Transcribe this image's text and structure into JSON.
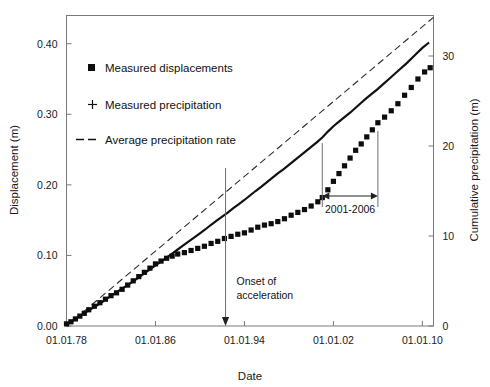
{
  "chart_data": {
    "type": "scatter",
    "title": "",
    "xlabel": "Date",
    "ylabel": "Displacement (m)",
    "y2label": "Cumulative precipitation (m)",
    "grid": false,
    "legend_position": "upper-left-inside",
    "xlim": [
      1978,
      2011
    ],
    "xtick_labels": [
      "01.01.78",
      "01.01.86",
      "01.01.94",
      "01.01.02",
      "01.01.10"
    ],
    "xtick_values": [
      1978,
      1986,
      1994,
      2002,
      2010
    ],
    "ylim": [
      0.0,
      0.44
    ],
    "ytick_labels": [
      "0.00",
      "0.10",
      "0.20",
      "0.30",
      "0.40"
    ],
    "ytick_values": [
      0.0,
      0.1,
      0.2,
      0.3,
      0.4
    ],
    "y2lim": [
      0,
      34.5
    ],
    "y2tick_labels": [
      "0",
      "10",
      "20",
      "30"
    ],
    "y2tick_values": [
      0,
      10,
      20,
      30
    ],
    "series": [
      {
        "name": "Measured displacements",
        "marker": "filled-square",
        "axis": "left",
        "units": "m",
        "points": [
          [
            1978.0,
            0.003
          ],
          [
            1978.4,
            0.006
          ],
          [
            1978.8,
            0.01
          ],
          [
            1979.2,
            0.014
          ],
          [
            1979.6,
            0.018
          ],
          [
            1980.0,
            0.023
          ],
          [
            1980.5,
            0.028
          ],
          [
            1981.0,
            0.033
          ],
          [
            1981.5,
            0.038
          ],
          [
            1982.0,
            0.043
          ],
          [
            1982.5,
            0.047
          ],
          [
            1983.0,
            0.052
          ],
          [
            1983.5,
            0.058
          ],
          [
            1984.0,
            0.064
          ],
          [
            1984.5,
            0.07
          ],
          [
            1985.0,
            0.076
          ],
          [
            1985.5,
            0.082
          ],
          [
            1986.0,
            0.088
          ],
          [
            1986.5,
            0.092
          ],
          [
            1987.0,
            0.096
          ],
          [
            1987.5,
            0.099
          ],
          [
            1988.0,
            0.102
          ],
          [
            1988.6,
            0.104
          ],
          [
            1989.2,
            0.107
          ],
          [
            1989.8,
            0.11
          ],
          [
            1990.4,
            0.113
          ],
          [
            1991.0,
            0.117
          ],
          [
            1991.6,
            0.12
          ],
          [
            1992.2,
            0.124
          ],
          [
            1992.8,
            0.127
          ],
          [
            1993.4,
            0.13
          ],
          [
            1994.0,
            0.132
          ],
          [
            1994.6,
            0.136
          ],
          [
            1995.2,
            0.14
          ],
          [
            1995.8,
            0.143
          ],
          [
            1996.4,
            0.145
          ],
          [
            1997.0,
            0.148
          ],
          [
            1997.6,
            0.152
          ],
          [
            1998.2,
            0.157
          ],
          [
            1998.8,
            0.161
          ],
          [
            1999.4,
            0.165
          ],
          [
            2000.0,
            0.17
          ],
          [
            2000.6,
            0.176
          ],
          [
            2001.0,
            0.182
          ],
          [
            2001.5,
            0.193
          ],
          [
            2002.0,
            0.205
          ],
          [
            2002.5,
            0.216
          ],
          [
            2003.0,
            0.227
          ],
          [
            2003.5,
            0.238
          ],
          [
            2004.0,
            0.249
          ],
          [
            2004.5,
            0.258
          ],
          [
            2005.0,
            0.268
          ],
          [
            2005.5,
            0.278
          ],
          [
            2006.0,
            0.288
          ],
          [
            2006.6,
            0.296
          ],
          [
            2007.2,
            0.305
          ],
          [
            2007.8,
            0.315
          ],
          [
            2008.4,
            0.327
          ],
          [
            2009.0,
            0.338
          ],
          [
            2009.6,
            0.35
          ],
          [
            2010.2,
            0.36
          ],
          [
            2010.7,
            0.366
          ]
        ]
      },
      {
        "name": "Measured precipitation",
        "marker": "plus",
        "axis": "right",
        "units": "m",
        "points": [
          [
            1978.0,
            0.2
          ],
          [
            1978.5,
            0.55
          ],
          [
            1979.0,
            0.95
          ],
          [
            1979.5,
            1.35
          ],
          [
            1980.0,
            1.75
          ],
          [
            1980.5,
            2.1
          ],
          [
            1981.0,
            2.5
          ],
          [
            1981.5,
            2.9
          ],
          [
            1982.0,
            3.35
          ],
          [
            1982.5,
            3.75
          ],
          [
            1983.0,
            4.15
          ],
          [
            1983.5,
            4.55
          ],
          [
            1984.0,
            4.95
          ],
          [
            1984.5,
            5.4
          ],
          [
            1985.0,
            5.85
          ],
          [
            1985.5,
            6.3
          ],
          [
            1986.0,
            6.75
          ],
          [
            1986.5,
            7.15
          ],
          [
            1987.0,
            7.6
          ],
          [
            1987.5,
            8.05
          ],
          [
            1988.0,
            8.5
          ],
          [
            1988.5,
            8.95
          ],
          [
            1989.0,
            9.4
          ],
          [
            1989.5,
            9.85
          ],
          [
            1990.0,
            10.3
          ],
          [
            1990.5,
            10.75
          ],
          [
            1991.0,
            11.25
          ],
          [
            1991.5,
            11.7
          ],
          [
            1992.0,
            12.15
          ],
          [
            1992.5,
            12.6
          ],
          [
            1993.0,
            13.1
          ],
          [
            1993.5,
            13.55
          ],
          [
            1994.0,
            14.0
          ],
          [
            1994.5,
            14.5
          ],
          [
            1995.0,
            15.0
          ],
          [
            1995.5,
            15.45
          ],
          [
            1996.0,
            15.95
          ],
          [
            1996.5,
            16.45
          ],
          [
            1997.0,
            16.95
          ],
          [
            1997.5,
            17.4
          ],
          [
            1998.0,
            17.9
          ],
          [
            1998.5,
            18.4
          ],
          [
            1999.0,
            18.9
          ],
          [
            1999.5,
            19.4
          ],
          [
            2000.0,
            19.9
          ],
          [
            2000.5,
            20.4
          ],
          [
            2001.0,
            20.95
          ],
          [
            2001.5,
            21.6
          ],
          [
            2002.0,
            22.2
          ],
          [
            2002.5,
            22.7
          ],
          [
            2003.0,
            23.2
          ],
          [
            2003.5,
            23.7
          ],
          [
            2004.0,
            24.25
          ],
          [
            2004.5,
            24.8
          ],
          [
            2005.0,
            25.35
          ],
          [
            2005.5,
            25.85
          ],
          [
            2006.0,
            26.35
          ],
          [
            2006.5,
            26.9
          ],
          [
            2007.0,
            27.45
          ],
          [
            2007.5,
            28.0
          ],
          [
            2008.0,
            28.55
          ],
          [
            2008.5,
            29.1
          ],
          [
            2009.0,
            29.7
          ],
          [
            2009.5,
            30.3
          ],
          [
            2010.0,
            30.9
          ],
          [
            2010.6,
            31.5
          ]
        ]
      },
      {
        "name": "Average precipitation rate",
        "marker": "dashed-line",
        "axis": "right",
        "units": "m",
        "points": [
          [
            1978.0,
            0.0
          ],
          [
            2011.0,
            34.3
          ]
        ]
      }
    ],
    "annotations": [
      {
        "name": "onset-of-acceleration",
        "text": "Onset of acceleration",
        "lines": [
          "Onset of",
          "acceleration"
        ],
        "x": 1992.3,
        "type": "vertical-arrow-down"
      },
      {
        "name": "acceleration-period",
        "text": "2001-2006",
        "x_start": 2001,
        "x_end": 2006,
        "type": "horizontal-double-arrow"
      }
    ]
  },
  "legend": {
    "items": [
      {
        "label": "Measured displacements",
        "marker": "filled-square"
      },
      {
        "label": "Measured precipitation",
        "marker": "plus"
      },
      {
        "label": "Average precipitation rate",
        "marker": "dashed-line"
      }
    ]
  }
}
